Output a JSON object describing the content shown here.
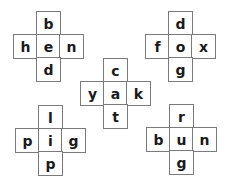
{
  "puzzles": [
    {
      "word": "hen",
      "top": "b",
      "left": "h",
      "center": "e",
      "right": "n",
      "bottom": "d"
    },
    {
      "word": "fox",
      "top": "d",
      "left": "f",
      "center": "o",
      "right": "x",
      "bottom": "g"
    },
    {
      "word": "yak",
      "top": "c",
      "left": "y",
      "center": "a",
      "right": "k",
      "bottom": "t"
    },
    {
      "word": "pig",
      "top": "l",
      "left": "p",
      "center": "i",
      "right": "g",
      "bottom": "p"
    },
    {
      "word": "bun",
      "top": "r",
      "left": "b",
      "center": "u",
      "right": "n",
      "bottom": "g"
    }
  ]
}
